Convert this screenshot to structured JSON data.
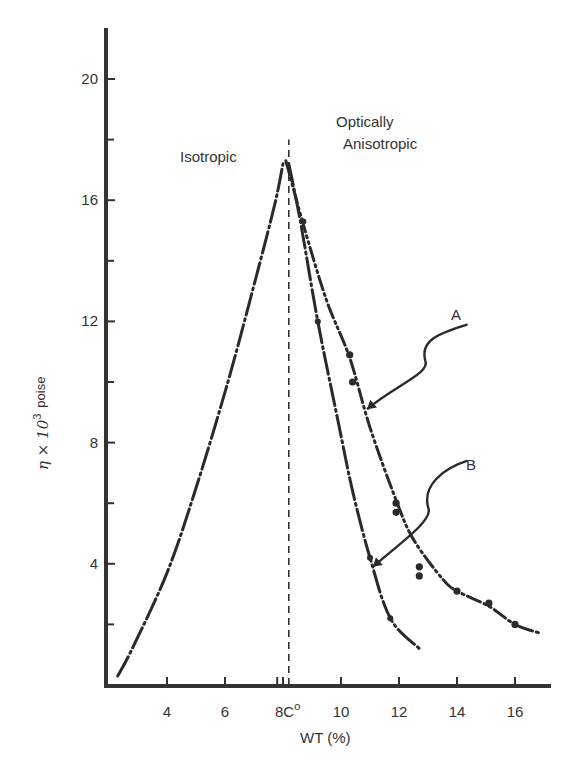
{
  "chart_data": {
    "type": "line",
    "title": "",
    "xlabel": "WT (%)",
    "ylabel": "η × 10³ poise",
    "ylabel_parts": {
      "symbol": "η × 10",
      "exp": "3",
      "unit": "poise"
    },
    "xlim": [
      2,
      17
    ],
    "ylim": [
      0,
      21.5
    ],
    "x_ticks": [
      {
        "value": 4,
        "label": "4"
      },
      {
        "value": 6,
        "label": "6"
      },
      {
        "value": 8,
        "label": "8"
      },
      {
        "value": 10,
        "label": "10"
      },
      {
        "value": 12,
        "label": "12"
      },
      {
        "value": 14,
        "label": "14"
      },
      {
        "value": 16,
        "label": "16"
      }
    ],
    "x_minor_ticks": [
      7.8
    ],
    "critical_label": {
      "value": 8.2,
      "label": "C°"
    },
    "y_ticks": [
      {
        "value": 4,
        "label": "4"
      },
      {
        "value": 8,
        "label": "8"
      },
      {
        "value": 12,
        "label": "12"
      },
      {
        "value": 16,
        "label": "16"
      },
      {
        "value": 20,
        "label": "20"
      }
    ],
    "y_minor_ticks": [
      2,
      6,
      10,
      14,
      18
    ],
    "grid": false,
    "legend": "none (series labeled by callout arrows A and B)",
    "region_labels": [
      {
        "text": "Isotropic",
        "x": 5.8,
        "y": 17.3
      },
      {
        "text": "Optically",
        "x": 9.5,
        "y": 19.1
      },
      {
        "text": "Anisotropic",
        "x": 9.6,
        "y": 17.9
      }
    ],
    "critical_concentration_line": {
      "x": 8.2,
      "y_from": 0,
      "y_to": 18.0,
      "style": "dashed"
    },
    "series": [
      {
        "name": "Isotropic branch",
        "style": "dash-dot",
        "x": [
          2.3,
          2.8,
          4.0,
          5.0,
          6.1,
          7.0,
          7.7,
          8.0
        ],
        "y": [
          0.3,
          1.2,
          3.7,
          6.5,
          10.0,
          13.2,
          15.8,
          17.2
        ]
      },
      {
        "name": "B",
        "style": "dash-dot",
        "x": [
          8.2,
          8.6,
          9.2,
          9.9,
          10.4,
          11.0,
          11.7,
          12.7
        ],
        "y": [
          17.2,
          15.3,
          12.0,
          8.7,
          6.4,
          4.2,
          2.2,
          1.2
        ]
      },
      {
        "name": "A",
        "style": "dash-dot-dot",
        "x": [
          8.1,
          8.7,
          9.5,
          10.3,
          11.0,
          11.9,
          12.5,
          13.5,
          14.0,
          15.1,
          16.0,
          16.9
        ],
        "y": [
          17.3,
          15.2,
          12.7,
          10.8,
          8.5,
          6.1,
          4.8,
          3.5,
          3.1,
          2.6,
          2.0,
          1.7
        ]
      }
    ],
    "markers": {
      "A": [
        {
          "x": 10.3,
          "y": 10.9
        },
        {
          "x": 10.4,
          "y": 10.0
        },
        {
          "x": 11.9,
          "y": 6.0
        },
        {
          "x": 11.9,
          "y": 5.7
        },
        {
          "x": 12.7,
          "y": 3.9
        },
        {
          "x": 12.7,
          "y": 3.6
        },
        {
          "x": 14.0,
          "y": 3.1
        },
        {
          "x": 15.1,
          "y": 2.7
        },
        {
          "x": 16.0,
          "y": 2.0
        }
      ],
      "B": [
        {
          "x": 8.7,
          "y": 15.3
        },
        {
          "x": 9.2,
          "y": 12.0
        },
        {
          "x": 11.0,
          "y": 4.2
        },
        {
          "x": 11.7,
          "y": 2.2
        }
      ]
    },
    "callouts": [
      {
        "label": "A",
        "label_at": {
          "x": 14.5,
          "y": 12.1
        },
        "arrow_to": {
          "x": 10.9,
          "y": 9.1
        }
      },
      {
        "label": "B",
        "label_at": {
          "x": 14.5,
          "y": 7.6
        },
        "arrow_to": {
          "x": 11.1,
          "y": 3.9
        }
      }
    ]
  },
  "labels": {
    "isotropic": "Isotropic",
    "optically": "Optically",
    "anisotropic": "Anisotropic",
    "callout_a": "A",
    "callout_b": "B",
    "xlabel": "WT (%)",
    "ylabel_symbol": "η × 10",
    "ylabel_exp": "3",
    "ylabel_unit": "poise",
    "x_critical_prefix": "8",
    "x_critical_suffix": "C",
    "x_critical_degree": "o"
  }
}
